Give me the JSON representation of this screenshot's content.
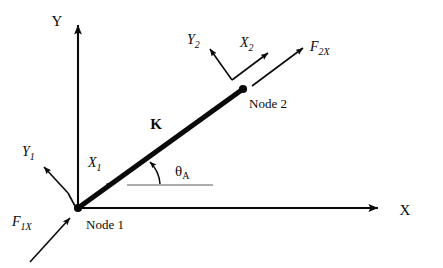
{
  "figure": {
    "type": "engineering-diagram",
    "background_color": "#ffffff",
    "line_color": "#0a0a0a"
  },
  "global_axes": {
    "y_label": "Y",
    "x_label": "X",
    "origin_px": [
      78,
      208
    ],
    "y_tip_px": [
      78,
      20
    ],
    "x_tip_px": [
      385,
      208
    ]
  },
  "element": {
    "stiffness_label": "K",
    "start_px": [
      78,
      208
    ],
    "end_px": [
      243,
      89
    ]
  },
  "nodes": [
    {
      "id": "node-1",
      "label": "Node 1",
      "position_px": [
        78,
        208
      ],
      "local_axes": {
        "x_label": "X",
        "x_sub": "1",
        "y_label": "Y",
        "y_sub": "1"
      },
      "force": {
        "label": "F",
        "sub": "1X",
        "direction": "toward node, up-right"
      }
    },
    {
      "id": "node-2",
      "label": "Node 2",
      "position_px": [
        243,
        89
      ],
      "local_axes": {
        "x_label": "X",
        "x_sub": "2",
        "y_label": "Y",
        "y_sub": "2"
      },
      "force": {
        "label": "F",
        "sub": "2X",
        "direction": "away from node, up-right"
      }
    }
  ],
  "angle": {
    "symbol": "θ",
    "subscript": "A",
    "measured_from": "global X axis",
    "reference_line_px": [
      127,
      185,
      213,
      185
    ]
  }
}
